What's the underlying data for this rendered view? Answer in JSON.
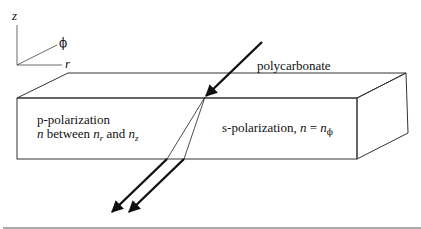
{
  "axes": {
    "z_label": "z",
    "phi_label": "ϕ",
    "r_label": "r"
  },
  "material": {
    "label": "polycarbonate"
  },
  "p_polarization": {
    "line1": "p-polarization",
    "n_symbol": "n",
    "between_text": " between ",
    "n_r": "n",
    "r_sub": "r",
    "and_text": " and ",
    "n_z": "n",
    "z_sub": "z"
  },
  "s_polarization": {
    "prefix": "s-polarization, ",
    "n_symbol": "n",
    "equals": " = ",
    "n_phi": "n",
    "phi_sub": "ϕ"
  },
  "colors": {
    "line": "#222222",
    "background": "#ffffff"
  }
}
